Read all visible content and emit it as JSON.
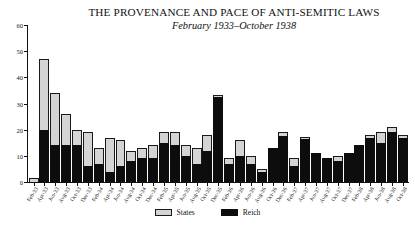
{
  "chart_data": {
    "type": "bar",
    "stacked": true,
    "title": "THE PROVENANCE AND PACE OF ANTI-SEMITIC LAWS",
    "subtitle": "February 1933–October 1938",
    "xlabel": "",
    "ylabel": "",
    "ylim": [
      0,
      60
    ],
    "yticks": [
      0,
      10,
      20,
      30,
      40,
      50,
      60
    ],
    "ytick_labels": [
      "0",
      "10",
      "20",
      "30",
      "40",
      "50",
      "60"
    ],
    "grid": false,
    "legend_position": "bottom-center",
    "colors": {
      "states": "#d4d4d4",
      "reich": "#0d0d0d",
      "axis": "#111111"
    },
    "categories": [
      "Feb-33",
      "Apr-33",
      "Jun-33",
      "Aug-33",
      "Oct-33",
      "Dec-33",
      "Feb-34",
      "Apr-34",
      "Jun-34",
      "Aug-34",
      "Oct-34",
      "Dec-34",
      "Feb-35",
      "Apr-35",
      "Jun-35",
      "Aug-35",
      "Oct-35",
      "Dec-35",
      "Feb-36",
      "Apr-36",
      "Jun-36",
      "Aug-36",
      "Oct-36",
      "Dec-36",
      "Feb-37",
      "Apr-37",
      "Jun-37",
      "Aug-37",
      "Oct-37",
      "Dec-37",
      "Feb-38",
      "Apr-38",
      "Jun-38",
      "Aug-38",
      "Oct-38"
    ],
    "series": [
      {
        "name": "Reich",
        "color": "#0d0d0d",
        "values": [
          0,
          20,
          14,
          14,
          14,
          6,
          7,
          4,
          6,
          8,
          9,
          9,
          15,
          14,
          10,
          7,
          12,
          32.5,
          7,
          10,
          7,
          4,
          13,
          17.5,
          6,
          16.5,
          11,
          9,
          8,
          11,
          14,
          17,
          15,
          19,
          17
        ]
      },
      {
        "name": "States",
        "color": "#d4d4d4",
        "values": [
          1.5,
          27,
          20,
          12,
          6,
          13,
          6,
          13,
          10,
          4,
          4,
          5,
          4,
          5,
          4,
          6,
          6,
          0.5,
          2,
          6,
          3,
          1,
          0,
          1.5,
          3,
          0.5,
          0,
          0,
          2,
          0,
          0,
          1,
          4,
          2,
          1
        ]
      }
    ],
    "totals": [
      1.5,
      47,
      34,
      26,
      20,
      19,
      13,
      17,
      16,
      12,
      13,
      14,
      19,
      19,
      14,
      13,
      18,
      33,
      9,
      16,
      10,
      5,
      13,
      19,
      9,
      17,
      11,
      9,
      10,
      11,
      14,
      18,
      19,
      21,
      18
    ]
  },
  "legend": {
    "items": [
      {
        "label": "States",
        "swatch": "states-swatch"
      },
      {
        "label": "Reich",
        "swatch": "reich-swatch"
      }
    ]
  }
}
